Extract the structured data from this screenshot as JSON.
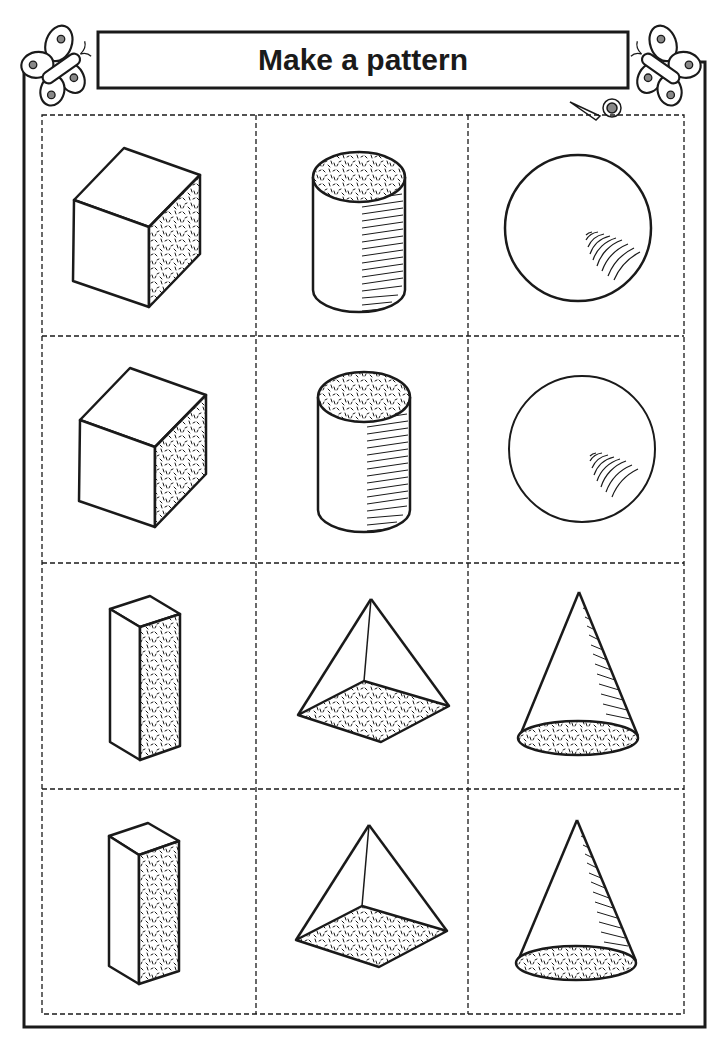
{
  "worksheet": {
    "title": "Make a pattern",
    "ink_color": "#1a1a1a",
    "paper_color": "#ffffff",
    "decorations": [
      {
        "name": "butterfly-left",
        "position": "top-left"
      },
      {
        "name": "butterfly-right",
        "position": "top-right"
      },
      {
        "name": "scissors",
        "position": "top-right of cut grid",
        "meaning": "cut along dashed lines"
      }
    ],
    "grid": {
      "rows": 4,
      "columns": 3,
      "cut_lines": "dashed",
      "cells": [
        [
          {
            "shape": "cube"
          },
          {
            "shape": "cylinder"
          },
          {
            "shape": "sphere"
          }
        ],
        [
          {
            "shape": "cube"
          },
          {
            "shape": "cylinder"
          },
          {
            "shape": "sphere"
          }
        ],
        [
          {
            "shape": "rectangular prism"
          },
          {
            "shape": "square pyramid"
          },
          {
            "shape": "cone"
          }
        ],
        [
          {
            "shape": "rectangular prism"
          },
          {
            "shape": "square pyramid"
          },
          {
            "shape": "cone"
          }
        ]
      ]
    }
  }
}
